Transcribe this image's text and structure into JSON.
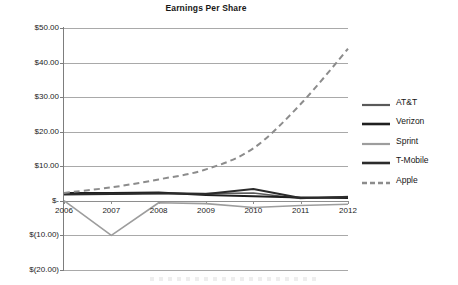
{
  "chart_data": {
    "type": "line",
    "title": "Earnings Per Share",
    "xlabel": "",
    "ylabel": "",
    "x": [
      "2006",
      "2007",
      "2008",
      "2009",
      "2010",
      "2011",
      "2012"
    ],
    "categories": [
      "2006",
      "2007",
      "2008",
      "2009",
      "2010",
      "2011",
      "2012"
    ],
    "ylim": [
      -20,
      50
    ],
    "y_ticks": [
      50,
      40,
      30,
      20,
      10,
      0,
      -10,
      -20
    ],
    "y_tick_labels": [
      "$50.00",
      "$40.00",
      "$30.00",
      "$20.00",
      "$10.00",
      "$-",
      "$(10.00)",
      "$(20.00)"
    ],
    "grid": true,
    "legend_position": "right",
    "series": [
      {
        "name": "AT&T",
        "color": "#5a5a5a",
        "style": "solid",
        "width": 1.6,
        "values": [
          1.9,
          1.95,
          2.16,
          2.12,
          2.29,
          0.66,
          1.25
        ]
      },
      {
        "name": "Verizon",
        "color": "#1f1f1f",
        "style": "solid",
        "width": 2.0,
        "values": [
          2.25,
          2.3,
          2.4,
          1.72,
          1.3,
          1.0,
          0.85
        ]
      },
      {
        "name": "Sprint",
        "color": "#9d9d9d",
        "style": "solid",
        "width": 1.6,
        "values": [
          0.05,
          -10.0,
          -0.55,
          -0.8,
          -1.9,
          -1.35,
          -1.0
        ]
      },
      {
        "name": "T-Mobile",
        "color": "#2b2b2b",
        "style": "solid",
        "width": 2.0,
        "values": [
          1.85,
          2.0,
          2.2,
          2.0,
          3.45,
          0.85,
          1.15
        ]
      },
      {
        "name": "Apple",
        "color": "#8c8c8c",
        "style": "dashed",
        "width": 2.0,
        "values": [
          2.3,
          3.9,
          6.2,
          9.1,
          15.2,
          28.0,
          44.0
        ]
      }
    ]
  },
  "legend": {
    "items": [
      {
        "label": "AT&T",
        "swatch": "line-swatch-solid"
      },
      {
        "label": "Verizon",
        "swatch": "line-swatch-solid"
      },
      {
        "label": "Sprint",
        "swatch": "line-swatch-solid"
      },
      {
        "label": "T-Mobile",
        "swatch": "line-swatch-solid"
      },
      {
        "label": "Apple",
        "swatch": "line-swatch-dashed"
      }
    ]
  }
}
